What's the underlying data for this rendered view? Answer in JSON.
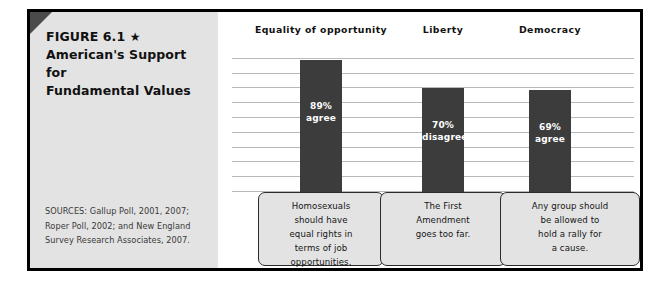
{
  "figure": {
    "label": "FIGURE 6.1",
    "star_glyph": "★",
    "title_line1": "American's Support for",
    "title_line2": "Fundamental Values",
    "sources_line1": "SOURCES: Gallup Poll, 2001, 2007;",
    "sources_line2": "Roper Poll, 2002; and New England",
    "sources_line3": "Survey Research Associates, 2007."
  },
  "colors": {
    "panel_gray": "#e3e3e3",
    "bar_dark": "#3c3c3c",
    "frame_black": "#000000",
    "gridline_gray": "#b9b9b9",
    "corner_fold": "#4b4b4b"
  },
  "chart_data": {
    "type": "bar",
    "title": "American's Support for Fundamental Values",
    "xlabel": "",
    "ylabel": "",
    "ylim": [
      0,
      100
    ],
    "grid": true,
    "legend": "none",
    "categories": [
      "Equality of opportunity",
      "Liberty",
      "Democracy"
    ],
    "values": [
      89,
      70,
      69
    ],
    "bars": [
      {
        "category": "Equality of opportunity",
        "value": 89,
        "value_label": "89%",
        "response_label": "agree",
        "statement": "Homosexuals should have equal rights in terms of job opportunities.",
        "statement_lines": [
          "Homosexuals",
          "should have",
          "equal rights in",
          "terms of job",
          "opportunities."
        ]
      },
      {
        "category": "Liberty",
        "value": 70,
        "value_label": "70%",
        "response_label": "disagree",
        "statement": "The First Amendment goes too far.",
        "statement_lines": [
          "The First",
          "Amendment",
          "goes too far."
        ]
      },
      {
        "category": "Democracy",
        "value": 69,
        "value_label": "69%",
        "response_label": "agree",
        "statement": "Any group should be allowed to hold a rally for a cause.",
        "statement_lines": [
          "Any group should",
          "be allowed to",
          "hold a rally for",
          "a cause."
        ]
      }
    ],
    "gridline_count": 10
  }
}
